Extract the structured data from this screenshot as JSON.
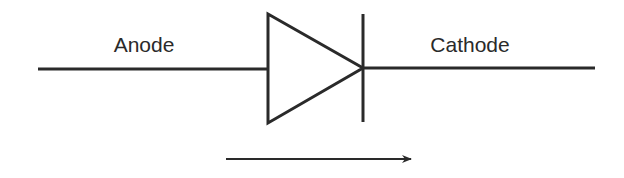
{
  "diagram": {
    "type": "diode-symbol",
    "labels": {
      "anode": "Anode",
      "cathode": "Cathode"
    },
    "arrow": {
      "direction": "right",
      "meaning": "current-flow"
    },
    "colors": {
      "stroke": "#2a2a2a",
      "background": "#ffffff"
    }
  }
}
